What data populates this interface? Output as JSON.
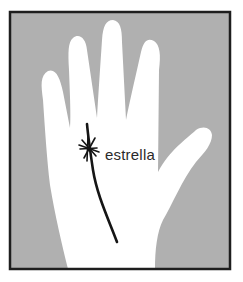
{
  "diagram": {
    "label": "estrella",
    "colors": {
      "background": "#b0b0b0",
      "hand": "#ffffff",
      "frame": "#1e1e1e",
      "line": "#151515",
      "label": "#2a2a2a"
    }
  }
}
